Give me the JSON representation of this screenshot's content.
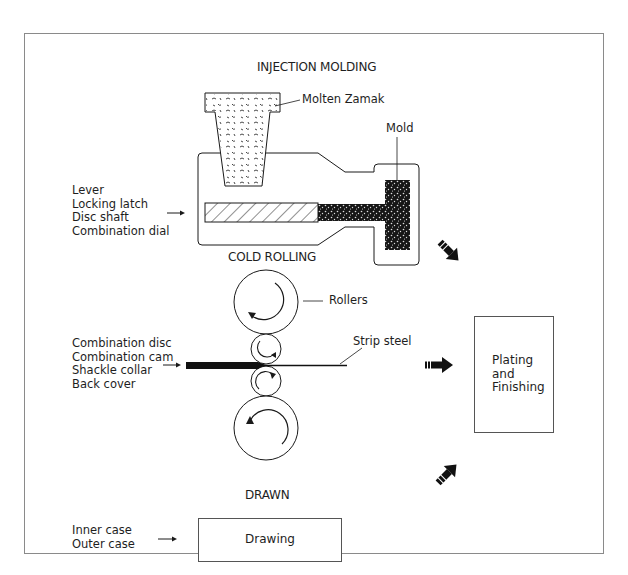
{
  "sections": {
    "injection": {
      "title": "INJECTION MOLDING",
      "parts": [
        "Lever",
        "Locking latch",
        "Disc shaft",
        "Combination dial"
      ],
      "callouts": {
        "molten": "Molten Zamak",
        "mold": "Mold"
      }
    },
    "cold_rolling": {
      "title": "COLD ROLLING",
      "parts": [
        "Combination disc",
        "Combination cam",
        "Shackle collar",
        "Back cover"
      ],
      "callouts": {
        "rollers": "Rollers",
        "strip": "Strip steel"
      }
    },
    "drawn": {
      "title": "DRAWN",
      "parts": [
        "Inner case",
        "Outer case"
      ],
      "process_box": "Drawing"
    }
  },
  "final_step": {
    "lines": [
      "Plating",
      "and",
      "Finishing"
    ]
  },
  "icons": {
    "flow_arrows": [
      "arrow-down-right-icon",
      "arrow-right-icon",
      "arrow-up-right-icon"
    ],
    "input_arrows": "arrow-right-icon"
  },
  "colors": {
    "line": "#1a1a1a",
    "frame": "#8a8a8a",
    "fill_dark": "#111111"
  }
}
